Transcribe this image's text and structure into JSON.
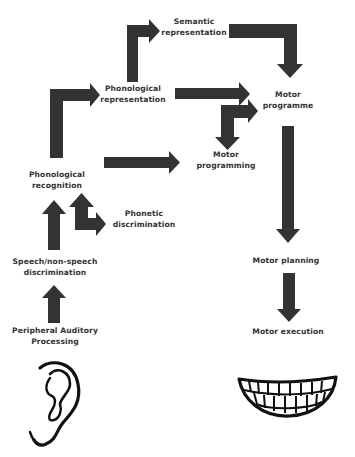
{
  "diagram": {
    "colors": {
      "arrow": "#333333",
      "text": "#333333",
      "background": "#ffffff"
    },
    "nodes": {
      "semantic_representation": "Semantic\nrepresentation",
      "phonological_representation": "Phonological\nrepresentation",
      "motor_programme": "Motor\nprogramme",
      "motor_programming": "Motor\nprogramming",
      "phonological_recognition": "Phonological\nrecognition",
      "phonetic_discrimination": "Phonetic\ndiscrimination",
      "speech_nonspeech_discrimination": "Speech/non-speech\ndiscrimination",
      "motor_planning": "Motor planning",
      "peripheral_auditory_processing": "Peripheral Auditory\nProcessing",
      "motor_execution": "Motor execution"
    },
    "edges": [
      {
        "from": "Phonological representation",
        "to": "Semantic representation"
      },
      {
        "from": "Semantic representation",
        "to": "Motor programme"
      },
      {
        "from": "Phonological recognition",
        "to": "Phonological representation"
      },
      {
        "from": "Phonological representation",
        "to": "Motor programme"
      },
      {
        "from": "Motor programming",
        "to": "Motor programme",
        "bidirectional": true
      },
      {
        "from": "Phonological recognition",
        "to": "Motor programming"
      },
      {
        "from": "Motor programme",
        "to": "Motor planning"
      },
      {
        "from": "Speech/non-speech discrimination",
        "to": "Phonological recognition"
      },
      {
        "from": "Phonetic discrimination",
        "to": "Phonological recognition",
        "bidirectional": true
      },
      {
        "from": "Peripheral Auditory Processing",
        "to": "Speech/non-speech discrimination"
      },
      {
        "from": "Motor planning",
        "to": "Motor execution"
      }
    ],
    "icons": {
      "input": "ear-icon",
      "output": "teeth-smile-icon"
    }
  }
}
